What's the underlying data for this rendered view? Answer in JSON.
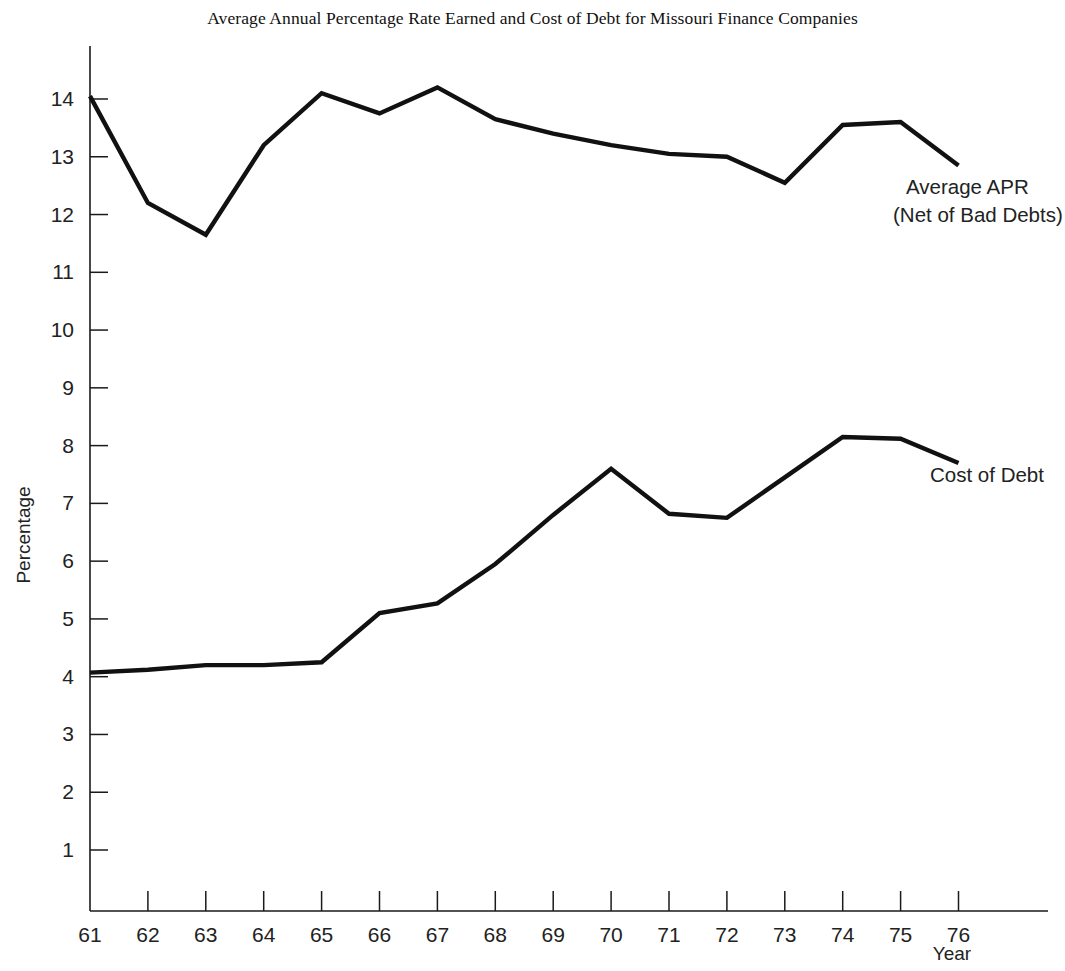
{
  "chart_data": {
    "type": "line",
    "title": "Average Annual Percentage Rate Earned and Cost of Debt for Missouri Finance Companies",
    "xlabel": "Year",
    "ylabel": "Percentage",
    "grid": false,
    "legend_position": "inline-right-annotations",
    "categories": [
      "61",
      "62",
      "63",
      "64",
      "65",
      "66",
      "67",
      "68",
      "69",
      "70",
      "71",
      "72",
      "73",
      "74",
      "75",
      "76"
    ],
    "x_tick_labels": [
      "61",
      "62",
      "63",
      "64",
      "65",
      "66",
      "67",
      "68",
      "69",
      "70",
      "71",
      "72",
      "73",
      "74",
      "75",
      "76"
    ],
    "y_tick_labels": [
      "1",
      "2",
      "3",
      "4",
      "5",
      "6",
      "7",
      "8",
      "9",
      "10",
      "11",
      "12",
      "13",
      "14"
    ],
    "xlim": [
      61,
      76
    ],
    "ylim": [
      0,
      14.6
    ],
    "series": [
      {
        "name": "Average APR (Net of Bad Debts)",
        "annotation_line1": "Average APR",
        "annotation_line2": "(Net of Bad Debts)",
        "color": "#111111",
        "values": [
          14.05,
          12.2,
          11.65,
          13.2,
          14.1,
          13.75,
          14.2,
          13.65,
          13.4,
          13.2,
          13.05,
          13.0,
          12.55,
          13.55,
          13.6,
          12.85
        ]
      },
      {
        "name": "Cost of Debt",
        "annotation_line1": "Cost of Debt",
        "annotation_line2": "",
        "color": "#111111",
        "values": [
          4.07,
          4.12,
          4.2,
          4.2,
          4.25,
          5.1,
          5.27,
          5.95,
          6.8,
          7.6,
          6.82,
          6.75,
          7.45,
          8.15,
          8.12,
          7.7
        ]
      }
    ]
  },
  "axes": {
    "y_axis_name": "percentage-axis",
    "x_axis_name": "year-axis"
  }
}
